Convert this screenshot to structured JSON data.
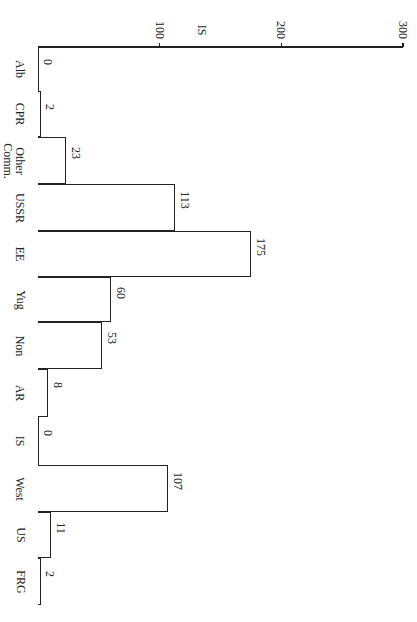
{
  "chart_data": {
    "type": "bar",
    "orientation": "horizontal (page rotated 90°)",
    "title": "",
    "xlabel": "",
    "ylabel": "",
    "axis_marker_label": "IS",
    "axis_marker_value": 135,
    "ticks": [
      "100",
      "200",
      "300"
    ],
    "ylim": [
      0,
      300
    ],
    "grid": false,
    "categories": [
      "Alb",
      "CPR",
      "Other Comm.",
      "USSR",
      "EE",
      "Yug",
      "Non",
      "AR",
      "IS",
      "West",
      "US",
      "FRG"
    ],
    "values": [
      0,
      2,
      23,
      113,
      175,
      60,
      53,
      8,
      0,
      107,
      11,
      2
    ],
    "value_labels": [
      "0",
      "2",
      "23",
      "113",
      "175",
      "60",
      "53",
      "8",
      "0",
      "107",
      "11",
      "2"
    ]
  }
}
